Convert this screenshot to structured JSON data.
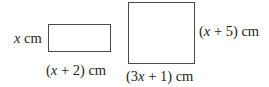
{
  "diagram": {
    "shapes": [
      {
        "id": "small-rectangle",
        "type": "rectangle",
        "height_label": {
          "var": "x",
          "rest": " cm"
        },
        "width_label": {
          "open": "(",
          "var": "x",
          "rest": " + 2) cm"
        }
      },
      {
        "id": "large-rectangle",
        "type": "rectangle",
        "height_label": {
          "open": "(",
          "var": "x",
          "rest": " + 5) cm"
        },
        "width_label": {
          "open": "(3",
          "var": "x",
          "rest": " + 1) cm"
        }
      }
    ]
  }
}
